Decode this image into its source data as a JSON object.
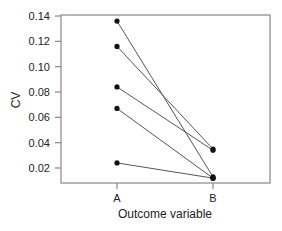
{
  "chart_data": {
    "type": "line",
    "title": "",
    "xlabel": "Outcome variable",
    "ylabel": "CV",
    "categories": [
      "A",
      "B"
    ],
    "ylim": [
      0.008,
      0.14
    ],
    "yticks": [
      "0.14",
      "0.12",
      "0.10",
      "0.08",
      "0.06",
      "0.04",
      "0.02"
    ],
    "ytick_values": [
      0.14,
      0.12,
      0.1,
      0.08,
      0.06,
      0.04,
      0.02
    ],
    "grid": false,
    "legend": null,
    "series": [
      {
        "name": "1",
        "values": [
          0.136,
          0.013
        ]
      },
      {
        "name": "2",
        "values": [
          0.116,
          0.035
        ]
      },
      {
        "name": "3",
        "values": [
          0.084,
          0.034
        ]
      },
      {
        "name": "4",
        "values": [
          0.067,
          0.012
        ]
      },
      {
        "name": "5",
        "values": [
          0.024,
          0.012
        ]
      }
    ]
  },
  "colors": {
    "axis": "#888888",
    "line": "#555555",
    "marker": "#111111"
  }
}
